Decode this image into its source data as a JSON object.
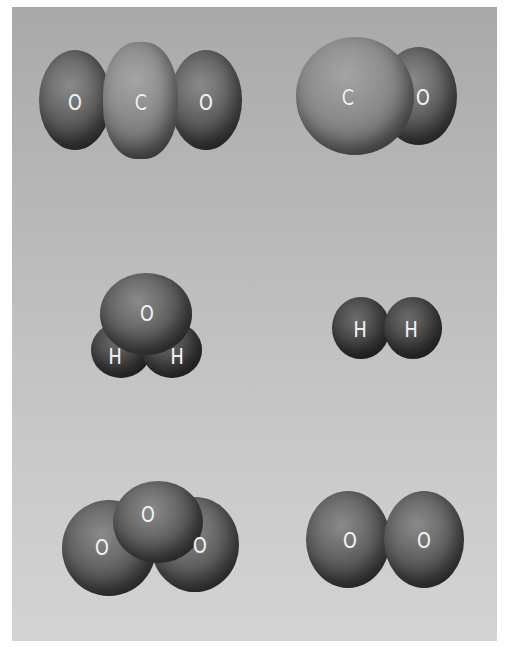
{
  "figure": {
    "background_gradient": [
      "#a9a9a9",
      "#d3d3d3"
    ],
    "molecules": [
      {
        "name": "carbon-dioxide",
        "atoms": [
          "O",
          "C",
          "O"
        ]
      },
      {
        "name": "carbon-monoxide",
        "atoms": [
          "C",
          "O"
        ]
      },
      {
        "name": "water",
        "atoms": [
          "O",
          "H",
          "H"
        ]
      },
      {
        "name": "hydrogen",
        "atoms": [
          "H",
          "H"
        ]
      },
      {
        "name": "ozone",
        "atoms": [
          "O",
          "O",
          "O"
        ]
      },
      {
        "name": "oxygen",
        "atoms": [
          "O",
          "O"
        ]
      }
    ]
  },
  "labels": {
    "co2": {
      "o1": "O",
      "c": "C",
      "o2": "O"
    },
    "co": {
      "c": "C",
      "o": "O"
    },
    "h2o": {
      "o": "O",
      "h1": "H",
      "h2": "H"
    },
    "h2": {
      "h1": "H",
      "h2": "H"
    },
    "o3": {
      "o1": "O",
      "o2": "O",
      "o3": "O"
    },
    "o2": {
      "o1": "O",
      "o2": "O"
    }
  }
}
